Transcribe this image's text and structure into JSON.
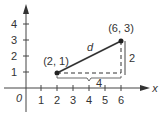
{
  "diagram": {
    "axes": {
      "x_label": "x",
      "y_label": "y",
      "origin_label": "0",
      "x_ticks": [
        "1",
        "2",
        "3",
        "4",
        "5",
        "6"
      ],
      "y_ticks": [
        "1",
        "2",
        "3",
        "4"
      ]
    },
    "points": [
      {
        "label": "(2, 1)",
        "x": 2,
        "y": 1
      },
      {
        "label": "(6, 3)",
        "x": 6,
        "y": 3
      }
    ],
    "segment_label": "d",
    "horizontal_leg_label": "4",
    "vertical_leg_label": "2",
    "colors": {
      "line": "#333333",
      "axis": "#444444",
      "text": "#333333"
    }
  }
}
